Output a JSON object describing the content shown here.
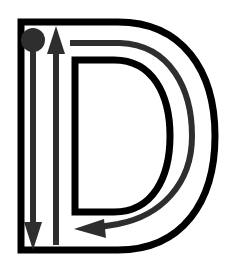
{
  "figure": {
    "name": "letter-stroke-order-diagram",
    "letter": "D",
    "case": "uppercase",
    "title": "Uppercase D stroke order tracing guide",
    "background_color": "#ffffff",
    "canvas": {
      "width": 234,
      "height": 266
    }
  },
  "glyph": {
    "name": "letter-d-outline",
    "description": "Hollow outline of capital letter D with inner counter",
    "stroke_color": "#000000",
    "fill_color": "#ffffff",
    "stroke_width": 7,
    "outer_path": "M 21 250 L 21 22 L 118 22 C 182 22 215 70 215 136 C 215 202 182 250 118 250 Z",
    "inner_path": "M 75 212 L 75 60 L 114 60 C 153 60 170 95 170 136 C 170 177 153 212 114 212 Z"
  },
  "strokes": {
    "color": "#2e2e2e",
    "shaft_width": 6,
    "items": [
      {
        "id": 1,
        "name": "stroke-1-vertical-down",
        "label": "Stroke 1: vertical line, top to bottom",
        "direction": "down",
        "has_start_dot": true,
        "start": {
          "x": 33,
          "y": 40
        },
        "end": {
          "x": 33,
          "y": 248
        },
        "shaft_path": "M 33 40 L 33 228",
        "arrowhead_points": "33,250 24,222 42,222",
        "start_dot": {
          "cx": 33,
          "cy": 40,
          "r": 12
        }
      },
      {
        "id": 2,
        "name": "stroke-2-vertical-up",
        "label": "Stroke 2: vertical line, bottom to top",
        "direction": "up",
        "has_start_dot": false,
        "start": {
          "x": 56,
          "y": 245
        },
        "end": {
          "x": 56,
          "y": 27
        },
        "shaft_path": "M 56 245 L 56 48",
        "arrowhead_points": "56,26 47,54 65,54"
      },
      {
        "id": 3,
        "name": "stroke-3-curve-bowl",
        "label": "Stroke 3: curved bowl, top around to bottom left",
        "direction": "clockwise-then-left",
        "has_start_dot": false,
        "start": {
          "x": 70,
          "y": 43
        },
        "end": {
          "x": 76,
          "y": 228
        },
        "shaft_path": "M 70 43 L 120 43 C 171 45 192 90 192 136 C 192 185 160 216 118 224 L 100 227",
        "arrowhead_points": "74,229 104,219 106,238"
      }
    ]
  }
}
